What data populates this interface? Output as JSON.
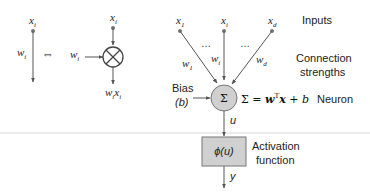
{
  "left_equivalence": {
    "input_symbol": "x",
    "input_subscript": "i",
    "weight_symbol": "w",
    "weight_subscript": "i",
    "equivalence_glyph": "⇔",
    "multiply_input_symbol": "x",
    "multiply_input_subscript": "i",
    "multiply_weight_symbol": "w",
    "multiply_weight_subscript": "i",
    "product_symbol": "w",
    "product_subscript": "i",
    "product_symbol2": "x",
    "product_subscript2": "i"
  },
  "neuron_diagram": {
    "inputs": [
      {
        "symbol": "x",
        "subscript": "1"
      },
      {
        "symbol": "x",
        "subscript": "i"
      },
      {
        "symbol": "x",
        "subscript": "d"
      }
    ],
    "weights": [
      {
        "symbol": "w",
        "subscript": "1"
      },
      {
        "symbol": "w",
        "subscript": "i"
      },
      {
        "symbol": "w",
        "subscript": "d"
      }
    ],
    "ellipsis": "…",
    "bias_label": "Bias",
    "bias_symbol": "(b)",
    "sum_glyph": "Σ",
    "equation": {
      "lhs": "Σ = ",
      "w": "w",
      "transpose": "T",
      "x": "x",
      "plus": " + ",
      "b": "b"
    },
    "net_output": "u",
    "activation": "ϕ(u)",
    "output": "y"
  },
  "legend_labels": {
    "inputs": "Inputs",
    "connection_line1": "Connection",
    "connection_line2": "strengths",
    "neuron": "Neuron",
    "activation_line1": "Activation",
    "activation_line2": "function"
  },
  "colors": {
    "neuron_fill": "#d0d0d0",
    "activation_fill": "#d0d0d0",
    "line": "#555555",
    "divider": "#e4e4e4"
  }
}
